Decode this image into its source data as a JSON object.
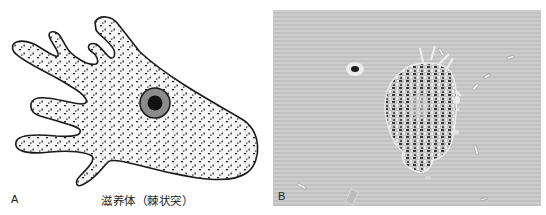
{
  "figure": {
    "panels": [
      {
        "id": "A",
        "label": "A",
        "type": "line-drawing",
        "caption": "滋养体（棘状突）",
        "subject": "trophozoite with acanthopodia (spiny projections)",
        "colors": {
          "outline": "#1a1a1a",
          "fill": "#f7f7f7",
          "granules": "#222222",
          "nucleus_ring": "#8c8c8c",
          "nucleolus": "#111111"
        }
      },
      {
        "id": "B",
        "label": "B",
        "type": "micrograph",
        "subject": "phase-contrast micrograph of trophozoite",
        "colors": {
          "background": "#c9c9c9",
          "cell_dark": "#2e2e2e",
          "cell_light": "#e6e6e6"
        }
      }
    ]
  }
}
